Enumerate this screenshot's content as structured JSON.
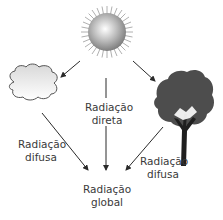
{
  "diagram": {
    "nodes": {
      "sun": {
        "icon": "sun-icon"
      },
      "cloud": {
        "icon": "cloud-icon"
      },
      "tree": {
        "icon": "tree-icon"
      }
    },
    "labels": {
      "direct_1": "Radiação",
      "direct_2": "direta",
      "diffuse_left_1": "Radiação",
      "diffuse_left_2": "difusa",
      "diffuse_right_1": "Radiação",
      "diffuse_right_2": "difusa",
      "global_1": "Radiação",
      "global_2": "global"
    },
    "colors": {
      "arrow": "#2a2a2a",
      "tree_canopy": "#4d4d4d",
      "text": "#3a3a3a"
    }
  }
}
